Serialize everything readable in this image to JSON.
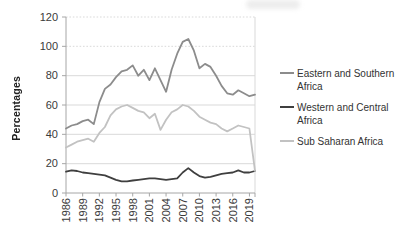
{
  "colors": {
    "axis": "#a6a6a6",
    "grid": "#d9d9d9",
    "tick_text": "#3a3a3a",
    "legend_text": "#333333",
    "background": "#ffffff"
  },
  "chart_data": {
    "type": "line",
    "title": "",
    "xlabel": "",
    "ylabel": "Percentages",
    "ylim": [
      0,
      120
    ],
    "y_ticks": [
      0,
      20,
      40,
      60,
      80,
      100,
      120
    ],
    "x_tick_labels": [
      "1986",
      "1989",
      "1992",
      "1995",
      "1998",
      "2001",
      "2004",
      "2007",
      "2010",
      "2013",
      "2016",
      "2019"
    ],
    "grid": "horizontal",
    "legend_position": "right",
    "x": [
      1986,
      1987,
      1988,
      1989,
      1990,
      1991,
      1992,
      1993,
      1994,
      1995,
      1996,
      1997,
      1998,
      1999,
      2000,
      2001,
      2002,
      2003,
      2004,
      2005,
      2006,
      2007,
      2008,
      2009,
      2010,
      2011,
      2012,
      2013,
      2014,
      2015,
      2016,
      2017,
      2018,
      2019,
      2020
    ],
    "series": [
      {
        "name": "Eastern and Southern Africa",
        "color": "#8c8c8c",
        "values": [
          44,
          46,
          47,
          49,
          50,
          47,
          62,
          71,
          74,
          79,
          83,
          84,
          87,
          80,
          84,
          77,
          85,
          77,
          69,
          84,
          95,
          103,
          105,
          97,
          85,
          88,
          86,
          80,
          73,
          68,
          67,
          70,
          68,
          66,
          67
        ]
      },
      {
        "name": "Western and Central Africa",
        "color": "#3f3f3f",
        "values": [
          14.5,
          15.5,
          15,
          14,
          13.5,
          13,
          12.5,
          12,
          10.5,
          9,
          8,
          8,
          8.5,
          9,
          9.5,
          10,
          10,
          9.5,
          9,
          9.5,
          10,
          14,
          17,
          14,
          11.5,
          10.5,
          11,
          12,
          13,
          13.5,
          14,
          15.5,
          14,
          14,
          15
        ]
      },
      {
        "name": "Sub Saharan Africa",
        "color": "#c2c2c2",
        "values": [
          31,
          33,
          35,
          36,
          37,
          35,
          41,
          45,
          53,
          57,
          59,
          60,
          58,
          56,
          55,
          51,
          54,
          43,
          50,
          55,
          57,
          60,
          59,
          56,
          52,
          50,
          48,
          47,
          44,
          42,
          44,
          46,
          45,
          44,
          15
        ]
      }
    ]
  }
}
